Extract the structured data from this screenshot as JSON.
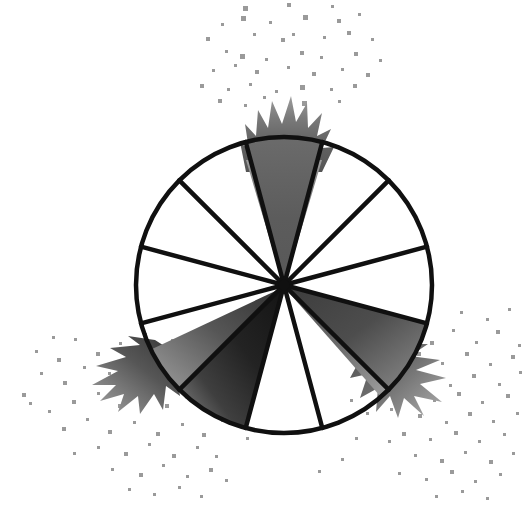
{
  "figure": {
    "title": "Twelve-sector circle diagram with three shaded bursting sectors",
    "background_color": "#ffffff",
    "canvas": {
      "width": 530,
      "height": 512
    }
  },
  "chart_data": {
    "type": "pie",
    "title": "Twelve-sector circle diagram with three shaded bursting sectors",
    "xlabel": "",
    "ylabel": "",
    "center": {
      "x": 284,
      "y": 285
    },
    "radius": 148,
    "sector_count": 12,
    "sector_angle_degrees": 30,
    "shaded_count": 3,
    "unshaded_count": 9,
    "fraction_shaded": "3/12",
    "categories": [
      "sector-1",
      "sector-2",
      "sector-3",
      "sector-4",
      "sector-5",
      "sector-6",
      "sector-7",
      "sector-8",
      "sector-9",
      "sector-10",
      "sector-11",
      "sector-12"
    ],
    "values": [
      1,
      1,
      1,
      1,
      1,
      1,
      1,
      1,
      1,
      1,
      1,
      1
    ],
    "sectors": [
      {
        "index": 1,
        "start_deg": -15,
        "end_deg": 15,
        "state": "shaded",
        "fill": "#5c5c5c",
        "burst": true
      },
      {
        "index": 2,
        "start_deg": 15,
        "end_deg": 45,
        "state": "unshaded",
        "fill": "#ffffff",
        "burst": false
      },
      {
        "index": 3,
        "start_deg": 45,
        "end_deg": 75,
        "state": "unshaded",
        "fill": "#ffffff",
        "burst": false
      },
      {
        "index": 4,
        "start_deg": 75,
        "end_deg": 105,
        "state": "unshaded",
        "fill": "#ffffff",
        "burst": false
      },
      {
        "index": 5,
        "start_deg": 105,
        "end_deg": 135,
        "state": "shaded",
        "fill": "#4a4a4a",
        "burst": true
      },
      {
        "index": 6,
        "start_deg": 135,
        "end_deg": 165,
        "state": "unshaded",
        "fill": "#ffffff",
        "burst": false
      },
      {
        "index": 7,
        "start_deg": 165,
        "end_deg": 195,
        "state": "unshaded",
        "fill": "#ffffff",
        "burst": false
      },
      {
        "index": 8,
        "start_deg": 195,
        "end_deg": 225,
        "state": "shaded",
        "fill": "#202020",
        "burst": true
      },
      {
        "index": 9,
        "start_deg": 225,
        "end_deg": 255,
        "state": "unshaded",
        "fill": "#ffffff",
        "burst": false
      },
      {
        "index": 10,
        "start_deg": 255,
        "end_deg": 285,
        "state": "unshaded",
        "fill": "#ffffff",
        "burst": false
      },
      {
        "index": 11,
        "start_deg": 285,
        "end_deg": 315,
        "state": "unshaded",
        "fill": "#ffffff",
        "burst": false
      },
      {
        "index": 12,
        "start_deg": 315,
        "end_deg": 345,
        "state": "unshaded",
        "fill": "#ffffff",
        "burst": false
      }
    ],
    "legend": [],
    "grid": false,
    "colors": {
      "outline": "#101010",
      "background": "#ffffff",
      "shade_top": "#5c5c5c",
      "shade_bottom_right": "#4a4a4a",
      "shade_bottom_left": "#202020",
      "speck": "#9a9a9a"
    },
    "line_width": 4.5,
    "bursts": [
      {
        "name": "top-burst",
        "direction_deg": 0,
        "tip_color": "#8e8e8e",
        "base_color": "#5c5c5c"
      },
      {
        "name": "bottom-right-burst",
        "direction_deg": 120,
        "tip_color": "#8e8e8e",
        "base_color": "#4a4a4a"
      },
      {
        "name": "bottom-left-burst",
        "direction_deg": 210,
        "tip_color": "#8e8e8e",
        "base_color": "#202020"
      }
    ],
    "speckle_clusters": [
      {
        "name": "top-speckles",
        "count": 42,
        "color": "#9a9a9a"
      },
      {
        "name": "bottom-left-speckles",
        "count": 55,
        "color": "#9a9a9a"
      },
      {
        "name": "bottom-right-speckles",
        "count": 58,
        "color": "#9a9a9a"
      }
    ]
  }
}
